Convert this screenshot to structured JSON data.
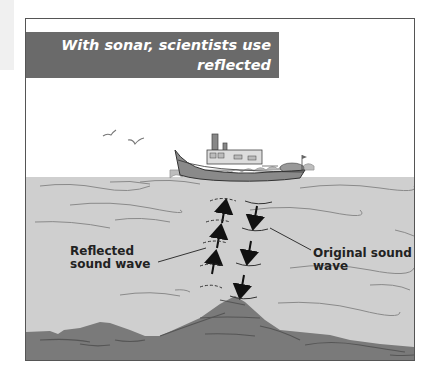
{
  "title": {
    "line1": "With sonar, scientists use reflected",
    "line2": "sound to map the ocean floor."
  },
  "labels": {
    "reflected_line1": "Reflected",
    "reflected_line2": "sound wave",
    "original_line1": "Original sound",
    "original_line2": "wave"
  },
  "colors": {
    "title_bg": "#6a6a6a",
    "sky": "#ffffff",
    "water": "#cfcfcf",
    "seafloor": "#7a7a7a",
    "boat_hull": "#8a8a8a",
    "arrow": "#111111"
  }
}
